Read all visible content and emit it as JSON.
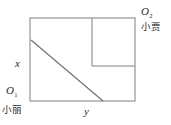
{
  "figure": {
    "type": "geometry-diagram",
    "stroke_color": "#808080",
    "diagonal_color": "#6e6e6e",
    "background_color": "#ffffff",
    "text_color": "#2b2b2b",
    "outer_rectangle": {
      "x1": 30,
      "y1": 18,
      "x2": 135,
      "y2": 101
    },
    "inner_square": {
      "x1": 92,
      "y1": 18,
      "x2": 135,
      "y2": 66
    },
    "divider_line": {
      "x1": 92,
      "y1": 66,
      "x2": 135,
      "y2": 66
    },
    "vertical_divider": {
      "x1": 92,
      "y1": 18,
      "x2": 92,
      "y2": 66
    },
    "diagonal_segment": {
      "x1": 31,
      "y1": 40,
      "x2": 103,
      "y2": 101
    }
  },
  "labels": {
    "origin_top_right": {
      "symbol": "O",
      "subscript": "2"
    },
    "origin_bottom_left": {
      "symbol": "O",
      "subscript": "1"
    },
    "person_top_right": "小贾",
    "person_bottom_left": "小丽",
    "side_vertical": "x",
    "side_horizontal": "y"
  }
}
